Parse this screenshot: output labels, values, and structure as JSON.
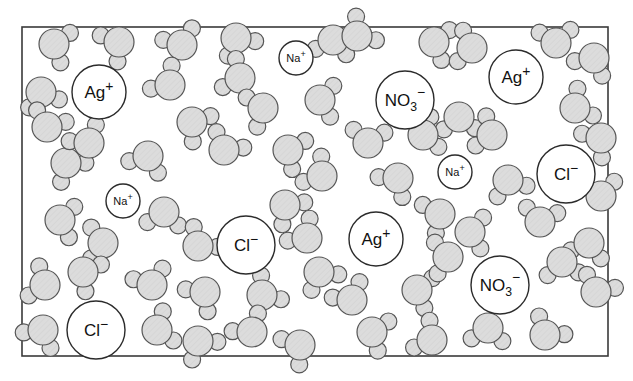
{
  "figure": {
    "caption": "",
    "background_color": "#ffffff",
    "frame": {
      "x": 22,
      "y": 27,
      "width": 586,
      "height": 329,
      "stroke_color": "#3a3a3a",
      "stroke_width": 1.6,
      "fill_color": "#ffffff"
    }
  },
  "style": {
    "molecule_fill": "#d9d9d9",
    "molecule_stroke": "#555555",
    "molecule_stroke_width": 1.2,
    "ion_fill": "#ffffff",
    "ion_stroke": "#2b2b2b",
    "ion_stroke_width": 1.4,
    "label_color": "#111111"
  },
  "chart_data": {
    "type": "scatter",
    "xlabel": "",
    "ylabel": "",
    "xlim": [
      22,
      608
    ],
    "ylim": [
      27,
      356
    ],
    "grid": false,
    "legend": "none",
    "species_counts": {
      "water": 62,
      "Ag+": 3,
      "Cl-": 3,
      "Na+": 3,
      "NO3-": 2
    },
    "series": [
      {
        "name": "Silver ion",
        "formula": "Ag",
        "charge": "+",
        "charge_sign": "positive",
        "radius": 27,
        "points": [
          {
            "x": 99,
            "y": 92
          },
          {
            "x": 516,
            "y": 77
          },
          {
            "x": 376,
            "y": 239
          }
        ]
      },
      {
        "name": "Chloride ion",
        "formula": "Cl",
        "charge": "−",
        "charge_sign": "negative",
        "radius": 29,
        "points": [
          {
            "x": 566,
            "y": 174
          },
          {
            "x": 246,
            "y": 245
          },
          {
            "x": 96,
            "y": 330
          }
        ]
      },
      {
        "name": "Sodium ion",
        "formula": "Na",
        "charge": "+",
        "charge_sign": "positive",
        "radius": 17,
        "points": [
          {
            "x": 296,
            "y": 58
          },
          {
            "x": 455,
            "y": 172
          },
          {
            "x": 123,
            "y": 201
          }
        ]
      },
      {
        "name": "Nitrate ion",
        "formula": "NO",
        "subscript": "3",
        "charge": "−",
        "charge_sign": "negative",
        "radius": 29,
        "points": [
          {
            "x": 405,
            "y": 100
          },
          {
            "x": 500,
            "y": 285
          }
        ]
      },
      {
        "name": "Water molecule",
        "formula": "H2O",
        "charge": "",
        "oxygen_radius": 15,
        "hydrogen_radius": 8.5,
        "points": [
          {
            "x": 54,
            "y": 44,
            "rot": 18
          },
          {
            "x": 119,
            "y": 42,
            "rot": 147
          },
          {
            "x": 182,
            "y": 45,
            "rot": 248
          },
          {
            "x": 236,
            "y": 38,
            "rot": 62
          },
          {
            "x": 240,
            "y": 78,
            "rot": 205
          },
          {
            "x": 333,
            "y": 40,
            "rot": 100
          },
          {
            "x": 357,
            "y": 36,
            "rot": 320
          },
          {
            "x": 434,
            "y": 42,
            "rot": 15
          },
          {
            "x": 472,
            "y": 48,
            "rot": 190
          },
          {
            "x": 556,
            "y": 43,
            "rot": 265
          },
          {
            "x": 594,
            "y": 58,
            "rot": 118
          },
          {
            "x": 41,
            "y": 92,
            "rot": 75
          },
          {
            "x": 47,
            "y": 127,
            "rot": 292
          },
          {
            "x": 170,
            "y": 85,
            "rot": 222
          },
          {
            "x": 192,
            "y": 122,
            "rot": 35
          },
          {
            "x": 263,
            "y": 108,
            "rot": 160
          },
          {
            "x": 320,
            "y": 100,
            "rot": 6
          },
          {
            "x": 368,
            "y": 143,
            "rot": 275
          },
          {
            "x": 459,
            "y": 117,
            "rot": 88
          },
          {
            "x": 492,
            "y": 135,
            "rot": 200
          },
          {
            "x": 575,
            "y": 108,
            "rot": 330
          },
          {
            "x": 601,
            "y": 138,
            "rot": 140
          },
          {
            "x": 66,
            "y": 163,
            "rot": 52
          },
          {
            "x": 89,
            "y": 143,
            "rot": 238
          },
          {
            "x": 148,
            "y": 156,
            "rot": 112
          },
          {
            "x": 224,
            "y": 150,
            "rot": 300
          },
          {
            "x": 288,
            "y": 150,
            "rot": 25
          },
          {
            "x": 322,
            "y": 176,
            "rot": 215
          },
          {
            "x": 398,
            "y": 178,
            "rot": 130
          },
          {
            "x": 423,
            "y": 135,
            "rot": 345
          },
          {
            "x": 508,
            "y": 180,
            "rot": 70
          },
          {
            "x": 601,
            "y": 196,
            "rot": 260
          },
          {
            "x": 60,
            "y": 220,
            "rot": 10
          },
          {
            "x": 103,
            "y": 243,
            "rot": 180
          },
          {
            "x": 164,
            "y": 212,
            "rot": 96
          },
          {
            "x": 198,
            "y": 246,
            "rot": 310
          },
          {
            "x": 285,
            "y": 205,
            "rot": 45
          },
          {
            "x": 307,
            "y": 238,
            "rot": 225
          },
          {
            "x": 440,
            "y": 214,
            "rot": 155
          },
          {
            "x": 470,
            "y": 232,
            "rot": 5
          },
          {
            "x": 540,
            "y": 222,
            "rot": 280
          },
          {
            "x": 589,
            "y": 243,
            "rot": 105
          },
          {
            "x": 45,
            "y": 285,
            "rot": 200
          },
          {
            "x": 83,
            "y": 272,
            "rot": 30
          },
          {
            "x": 152,
            "y": 285,
            "rot": 250
          },
          {
            "x": 205,
            "y": 292,
            "rot": 135
          },
          {
            "x": 262,
            "y": 295,
            "rot": 320
          },
          {
            "x": 319,
            "y": 272,
            "rot": 60
          },
          {
            "x": 352,
            "y": 300,
            "rot": 240
          },
          {
            "x": 417,
            "y": 290,
            "rot": 15
          },
          {
            "x": 448,
            "y": 257,
            "rot": 175
          },
          {
            "x": 562,
            "y": 262,
            "rot": 85
          },
          {
            "x": 596,
            "y": 292,
            "rot": 295
          },
          {
            "x": 43,
            "y": 330,
            "rot": 120
          },
          {
            "x": 157,
            "y": 330,
            "rot": 340
          },
          {
            "x": 198,
            "y": 341,
            "rot": 55
          },
          {
            "x": 252,
            "y": 332,
            "rot": 235
          },
          {
            "x": 300,
            "y": 345,
            "rot": 145
          },
          {
            "x": 372,
            "y": 332,
            "rot": 20
          },
          {
            "x": 432,
            "y": 340,
            "rot": 210
          },
          {
            "x": 488,
            "y": 328,
            "rot": 95
          },
          {
            "x": 545,
            "y": 335,
            "rot": 305
          }
        ]
      }
    ]
  }
}
